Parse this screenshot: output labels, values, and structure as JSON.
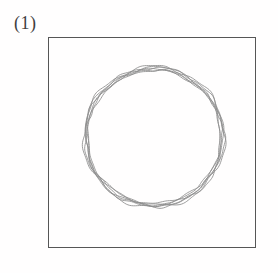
{
  "figure": {
    "label": "(1)",
    "background_color": "#fffefe",
    "width": 278,
    "height": 273
  },
  "frame": {
    "name": "plot-border",
    "x": 48,
    "y": 37,
    "width": 208,
    "height": 211,
    "stroke_color": "#565656",
    "stroke_width": 1.4,
    "fill": "none"
  },
  "chart_data": {
    "type": "line",
    "title": "(1)",
    "subtitle": "",
    "xlabel": "",
    "ylabel": "",
    "grid": false,
    "legend_position": "none",
    "tick_labels": {
      "x": [],
      "y": []
    },
    "axis_box": {
      "x_min": 48,
      "x_max": 256,
      "y_min": 37,
      "y_max": 248
    },
    "xlim": [
      48,
      256
    ],
    "ylim": [
      37,
      248
    ],
    "circle": {
      "center_x": 154,
      "center_y": 137,
      "radius": 70,
      "stroke_color": "#8c8c8c"
    },
    "series": [
      {
        "name": "contour-iteration-1",
        "closed": true,
        "stroke_color": "#7a7a7a",
        "radius": 70.5,
        "center": [
          154,
          137
        ],
        "wobble_amplitude": 1.6,
        "wobble_lobes": 7,
        "phase_deg": 10
      },
      {
        "name": "contour-iteration-2",
        "closed": true,
        "stroke_color": "#8c8c8c",
        "radius": 69.6,
        "center": [
          154.4,
          137.2
        ],
        "wobble_amplitude": 1.3,
        "wobble_lobes": 9,
        "phase_deg": 62
      },
      {
        "name": "contour-iteration-3",
        "closed": true,
        "stroke_color": "#8c8c8c",
        "radius": 68.8,
        "center": [
          153.6,
          136.6
        ],
        "wobble_amplitude": 1.5,
        "wobble_lobes": 5,
        "phase_deg": 130
      },
      {
        "name": "contour-iteration-4",
        "closed": true,
        "stroke_color": "#a2a2a2",
        "radius": 67.9,
        "center": [
          154.2,
          137.5
        ],
        "wobble_amplitude": 1.1,
        "wobble_lobes": 11,
        "phase_deg": 205
      },
      {
        "name": "contour-iteration-5",
        "closed": true,
        "stroke_color": "#8c8c8c",
        "radius": 67.2,
        "center": [
          153.8,
          137.0
        ],
        "wobble_amplitude": 1.4,
        "wobble_lobes": 6,
        "phase_deg": 275
      },
      {
        "name": "contour-iteration-6",
        "closed": true,
        "stroke_color": "#a2a2a2",
        "radius": 66.5,
        "center": [
          154.0,
          136.8
        ],
        "wobble_amplitude": 0.9,
        "wobble_lobes": 8,
        "phase_deg": 330
      }
    ]
  }
}
